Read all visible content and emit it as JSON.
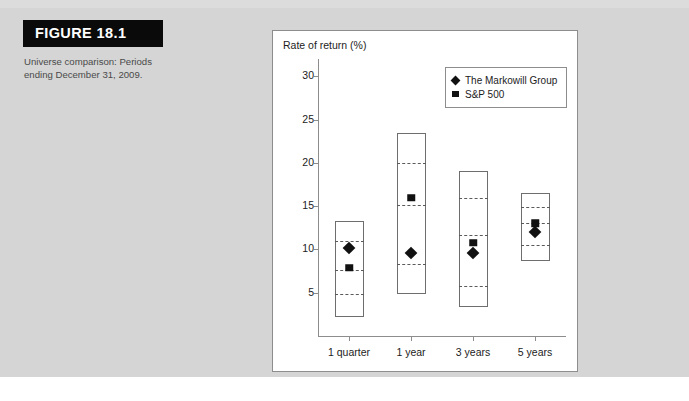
{
  "figure": {
    "header_label": "FIGURE 18.1",
    "caption": "Universe comparison: Periods ending December 31, 2009.",
    "header_bg": "#0a0a0a",
    "page_bg": "#d5d5d5"
  },
  "legend": {
    "entries": [
      {
        "label": "The Markowill Group",
        "marker": "diamond-marker",
        "color": "#111111"
      },
      {
        "label": "S&P 500",
        "marker": "square-marker",
        "color": "#111111"
      }
    ]
  },
  "chart_data": {
    "type": "bar",
    "title": "",
    "ylabel": "Rate of return (%)",
    "xlabel": "",
    "ylim": [
      0,
      32
    ],
    "yticks": [
      5,
      10,
      15,
      20,
      25,
      30
    ],
    "ytick_labels": [
      "5",
      "10",
      "15",
      "20",
      "25",
      "30"
    ],
    "grid": false,
    "legend_position": "upper-right",
    "categories": [
      "1 quarter",
      "1 year",
      "3 years",
      "5 years"
    ],
    "boxes": [
      {
        "category": "1 quarter",
        "top": 13.3,
        "bottom": 2.2,
        "quartiles": [
          11.0,
          7.6,
          4.9
        ]
      },
      {
        "category": "1 year",
        "top": 23.4,
        "bottom": 4.8,
        "quartiles": [
          20.0,
          15.1,
          8.3
        ]
      },
      {
        "category": "3 years",
        "top": 19.1,
        "bottom": 3.4,
        "quartiles": [
          16.0,
          11.7,
          5.8
        ]
      },
      {
        "category": "5 years",
        "top": 16.5,
        "bottom": 8.7,
        "quartiles": [
          14.9,
          13.0,
          10.5
        ]
      }
    ],
    "series": [
      {
        "name": "The Markowill Group",
        "marker": "diamond",
        "values": [
          10.2,
          9.6,
          9.6,
          12.0
        ]
      },
      {
        "name": "S&P 500",
        "marker": "square",
        "values": [
          7.9,
          16.0,
          10.8,
          13.0
        ]
      }
    ]
  }
}
